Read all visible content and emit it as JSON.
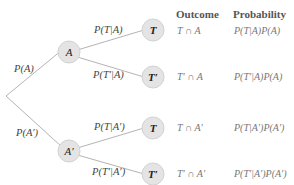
{
  "diagram": {
    "type": "probability-tree",
    "root_branches": [
      {
        "label": "P(A)",
        "node": "A"
      },
      {
        "label": "P(A′)",
        "node": "A′"
      }
    ],
    "second_level": [
      {
        "label": "P(T|A)",
        "node": "T"
      },
      {
        "label": "P(T′|A)",
        "node": "T′"
      },
      {
        "label": "P(T|A′)",
        "node": "T"
      },
      {
        "label": "P(T′|A′)",
        "node": "T′"
      }
    ],
    "table": {
      "headers": {
        "outcome": "Outcome",
        "probability": "Probability"
      },
      "rows": [
        {
          "outcome": "T ∩ A",
          "probability": "P(T|A)P(A)"
        },
        {
          "outcome": "T′ ∩ A",
          "probability": "P(T′|A)P(A)"
        },
        {
          "outcome": "T ∩ A′",
          "probability": "P(T|A′)P(A′)"
        },
        {
          "outcome": "T′ ∩ A′",
          "probability": "P(T′|A′)P(A′)"
        }
      ]
    },
    "colors": {
      "line": "#b0b0b0",
      "node_fill": "#e4e4e4",
      "node_stroke": "#cfcfcf"
    }
  }
}
